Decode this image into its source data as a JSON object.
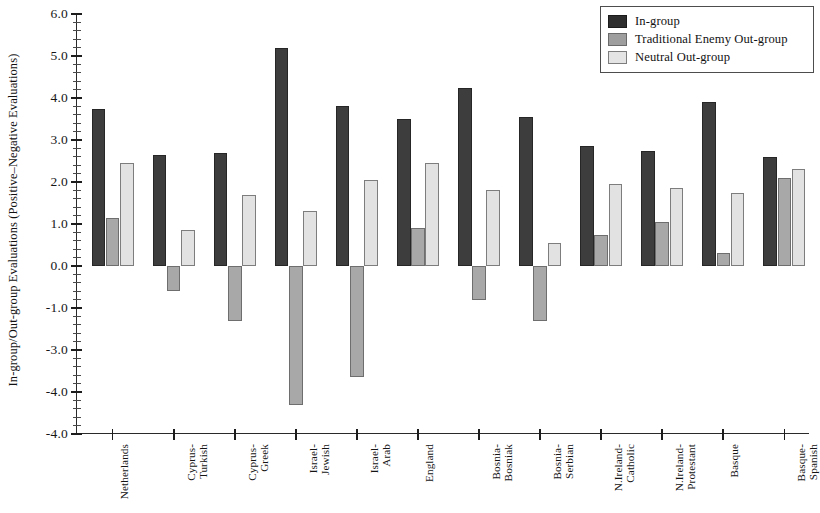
{
  "chart_data": {
    "type": "bar",
    "title": "",
    "xlabel": "",
    "ylabel": "In-group/Out-group Evaluations (Positive–Negative Evaluations)",
    "ylim": [
      -4.0,
      6.0
    ],
    "ytick_labels": [
      "6.0",
      "5.0",
      "4.0",
      "3.0",
      "2.0",
      "1.0",
      "0.0",
      "-1.0",
      "-3.0",
      "-4.0"
    ],
    "ytick_values": [
      6.0,
      5.0,
      4.0,
      3.0,
      2.0,
      1.0,
      0.0,
      -1.0,
      -2.0,
      -3.0,
      -4.0
    ],
    "minor_tick_step": 0.2,
    "grid": false,
    "legend_position": "top-right",
    "categories": [
      "Netherlands",
      "Cyprus-Turkish",
      "Cyprus-Greek",
      "Israel-Jewish",
      "Israel-Arab",
      "England",
      "Bosnia-Bosniak",
      "Bosnia-Serbian",
      "N.Ireland-Catholic",
      "N.Ireland-Protestant",
      "Basque",
      "Basque-Spanish"
    ],
    "category_lines": [
      [
        "Netherlands"
      ],
      [
        "Cyprus-",
        "Turkish"
      ],
      [
        "Cyprus-",
        "Greek"
      ],
      [
        "Israel-",
        "Jewish"
      ],
      [
        "Israel-",
        "Arab"
      ],
      [
        "England"
      ],
      [
        "Bosnia-",
        "Bosniak"
      ],
      [
        "Bosnia-",
        "Serbian"
      ],
      [
        "N.Ireland-",
        "Catholic"
      ],
      [
        "N.Ireland-",
        "Protestant"
      ],
      [
        "Basque"
      ],
      [
        "Basque-",
        "Spanish"
      ]
    ],
    "series": [
      {
        "name": "In-group",
        "color": "#3d3d3d",
        "values": [
          3.75,
          2.65,
          2.7,
          5.2,
          3.8,
          3.5,
          4.25,
          3.55,
          2.85,
          2.75,
          3.9,
          2.6
        ]
      },
      {
        "name": "Traditional Enemy Out-group",
        "color": "#a8a8a8",
        "values": [
          1.15,
          -0.6,
          -1.3,
          -3.3,
          -2.65,
          0.9,
          -0.8,
          -1.3,
          0.75,
          1.05,
          0.3,
          2.1
        ]
      },
      {
        "name": "Neutral Out-group",
        "color": "#e2e2e2",
        "values": [
          2.45,
          0.85,
          1.7,
          1.3,
          2.05,
          2.45,
          1.8,
          0.55,
          1.95,
          1.85,
          1.75,
          2.3
        ]
      }
    ]
  },
  "legend": {
    "items": [
      {
        "label": "In-group",
        "swatch": "ingroup"
      },
      {
        "label": "Traditional Enemy Out-group",
        "swatch": "enemy"
      },
      {
        "label": "Neutral Out-group",
        "swatch": "neutral"
      }
    ]
  }
}
